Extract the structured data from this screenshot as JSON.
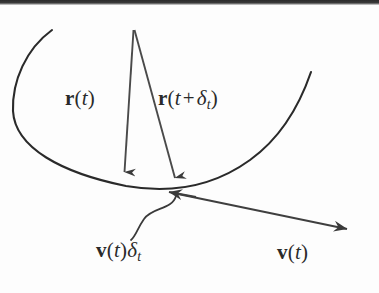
{
  "figure": {
    "kind": "math-diagram",
    "description_title": "Position and velocity vectors on a trajectory",
    "background_color": "#fdfdfd",
    "ink_color": "#2a2a2a",
    "scan_band_color": "#2b2b2b",
    "labels": {
      "position_vector": {
        "name": "r-of-t",
        "vector_symbol": "r",
        "open_paren": "(",
        "argument": "t",
        "close_paren": ")"
      },
      "position_vector_later": {
        "name": "r-of-t-plus-delta-t",
        "vector_symbol": "r",
        "open_paren": "(",
        "argument": "t",
        "operator": "+",
        "delta_symbol": "δ",
        "delta_subscript": "t",
        "close_paren": ")"
      },
      "displacement": {
        "name": "v-of-t-times-delta-t",
        "vector_symbol": "v",
        "open_paren": "(",
        "argument": "t",
        "close_paren": ")",
        "delta_symbol": "δ",
        "delta_subscript": "t"
      },
      "velocity": {
        "name": "v-of-t",
        "vector_symbol": "v",
        "open_paren": "(",
        "argument": "t",
        "close_paren": ")"
      }
    },
    "geometry": {
      "trajectory_curve": "M 52 30 C 24 48 12 80 13 110 C 15 145 60 172 124 185 C 200 200 268 150 310 72",
      "arrow_origin": {
        "x": 133,
        "y": 29
      },
      "arrow_r_t_tip": {
        "x": 124,
        "y": 184
      },
      "arrow_r_t_dt_tip": {
        "x": 176,
        "y": 191
      },
      "tangent_line_start": {
        "x": 166,
        "y": 193
      },
      "tangent_line_end": {
        "x": 356,
        "y": 233
      },
      "brace_squiggle": "M 213 203 C 212 216 188 216 178 224 C 168 232 168 240 163 246",
      "curve_low_point": {
        "x": 180,
        "y": 196
      },
      "leftmost_point": {
        "x": 13,
        "y": 109
      }
    }
  }
}
